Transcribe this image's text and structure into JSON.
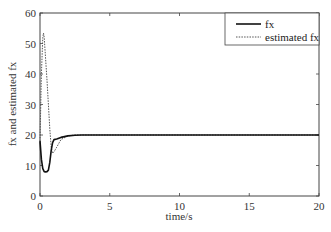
{
  "chart_data": {
    "type": "line",
    "title": "",
    "xlabel": "time/s",
    "ylabel": "fx and estimated fx",
    "xlim": [
      0,
      20
    ],
    "ylim": [
      0,
      60
    ],
    "xticks": [
      0,
      5,
      10,
      15,
      20
    ],
    "yticks": [
      0,
      10,
      20,
      30,
      40,
      50,
      60
    ],
    "grid": false,
    "legend_position": "upper right",
    "series": [
      {
        "name": "fx",
        "style": "solid",
        "color": "#111111",
        "x": [
          0,
          0.1,
          0.2,
          0.3,
          0.4,
          0.5,
          0.6,
          0.7,
          0.8,
          0.9,
          1.0,
          1.2,
          1.5,
          2.0,
          2.5,
          3,
          5,
          10,
          15,
          20
        ],
        "y": [
          18,
          12,
          9,
          8,
          7.9,
          8,
          8.5,
          11,
          15,
          17.5,
          18.5,
          18.7,
          19.2,
          19.7,
          19.9,
          20,
          20,
          20,
          20,
          20
        ]
      },
      {
        "name": "estimated fx",
        "style": "dotted",
        "color": "#555555",
        "x": [
          0,
          0.1,
          0.2,
          0.25,
          0.3,
          0.4,
          0.5,
          0.6,
          0.7,
          0.8,
          0.9,
          1.0,
          1.2,
          1.5,
          2.0,
          2.5,
          3,
          5,
          10,
          15,
          20
        ],
        "y": [
          18,
          40,
          52,
          53.4,
          52,
          45,
          38,
          30,
          22,
          16,
          14,
          14.5,
          16,
          18.5,
          19.7,
          20,
          20,
          20,
          20,
          20,
          20
        ]
      }
    ]
  },
  "legend": {
    "items": [
      {
        "label": "fx"
      },
      {
        "label": "estimated fx"
      }
    ]
  }
}
